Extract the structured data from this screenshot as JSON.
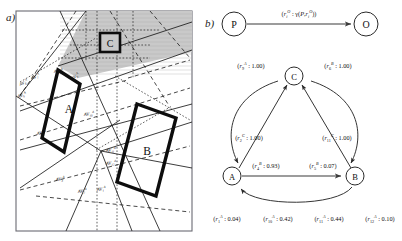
{
  "figure": {
    "panel_a_letter": "a)",
    "panel_b_letter": "b)"
  },
  "panel_a": {
    "region_labels": [
      {
        "id": "rect-a",
        "text": "A"
      },
      {
        "id": "rect-b",
        "text": "B"
      },
      {
        "id": "box-c",
        "text": "C"
      }
    ],
    "av_labels": [
      {
        "id": "av1",
        "base": "AV",
        "sub": "1",
        "sup": "A"
      },
      {
        "id": "av2",
        "base": "AV",
        "sub": "2",
        "sup": "A"
      },
      {
        "id": "av3",
        "base": "AV",
        "sub": "3",
        "sup": "A"
      },
      {
        "id": "av4",
        "base": "AV",
        "sub": "4",
        "sup": "A"
      },
      {
        "id": "av5",
        "base": "AV",
        "sub": "5",
        "sup": "A"
      },
      {
        "id": "av6",
        "base": "AV",
        "sub": "6",
        "sup": "A"
      },
      {
        "id": "av7",
        "base": "AV",
        "sub": "7",
        "sup": "A"
      },
      {
        "id": "av8",
        "base": "AV",
        "sub": "8",
        "sup": "A"
      },
      {
        "id": "av9",
        "base": "AV",
        "sub": "9",
        "sup": "A"
      },
      {
        "id": "av10",
        "base": "AV",
        "sub": "10",
        "sup": "A"
      },
      {
        "id": "av11",
        "base": "AV",
        "sub": "11",
        "sup": "A"
      },
      {
        "id": "av12",
        "base": "AV",
        "sub": "12",
        "sup": "A"
      }
    ],
    "shaded_region_color": "#c9c9c9",
    "border_color": "#6b6b73"
  },
  "panel_b": {
    "top_diagram": {
      "source_node": "P",
      "target_node": "O",
      "edge_label_full": "(r i O : γ(P, r i O))",
      "edge_label_parts": {
        "open": "(",
        "r": "r",
        "sub": "i",
        "sup": "O",
        "colon": " : ",
        "gamma": "γ",
        "arg_open": "(",
        "arg_p": "P",
        "comma": ",",
        "arg_r": "r",
        "arg_sub": "i",
        "arg_sup": "O",
        "close": "))"
      }
    },
    "graph": {
      "nodes": [
        {
          "id": "A",
          "label": "A"
        },
        {
          "id": "B",
          "label": "B"
        },
        {
          "id": "C",
          "label": "C"
        }
      ],
      "edge_labels": [
        {
          "id": "e-c-a",
          "r": "r",
          "sub": "9",
          "sup": "A",
          "value": "1.00"
        },
        {
          "id": "e-c-b",
          "r": "r",
          "sub": "6",
          "sup": "B",
          "value": "1.00"
        },
        {
          "id": "e-a-c",
          "r": "r",
          "sub": "2",
          "sup": "C",
          "value": "1.00"
        },
        {
          "id": "e-b-c",
          "r": "r",
          "sub": "11",
          "sup": "C",
          "value": "1.00"
        },
        {
          "id": "e-a-b1",
          "r": "r",
          "sub": "4",
          "sup": "B",
          "value": "0.93"
        },
        {
          "id": "e-a-b2",
          "r": "r",
          "sub": "5",
          "sup": "B",
          "value": "0.07"
        },
        {
          "id": "e-bot1",
          "r": "r",
          "sub": "1",
          "sup": "A",
          "value": "0.04"
        },
        {
          "id": "e-bot2",
          "r": "r",
          "sub": "10",
          "sup": "A",
          "value": "0.42"
        },
        {
          "id": "e-bot3",
          "r": "r",
          "sub": "11",
          "sup": "A",
          "value": "0.44"
        },
        {
          "id": "e-bot4",
          "r": "r",
          "sub": "12",
          "sup": "A",
          "value": "0.10"
        }
      ]
    }
  }
}
